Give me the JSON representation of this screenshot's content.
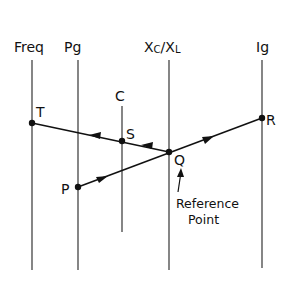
{
  "diagram": {
    "type": "nomogram",
    "axes": [
      {
        "id": "freq",
        "label": "Freq",
        "x": 32,
        "y1": 60,
        "y2": 270
      },
      {
        "id": "pg",
        "label": "Pg",
        "x": 78,
        "y1": 60,
        "y2": 270
      },
      {
        "id": "c",
        "label": "C",
        "x": 122,
        "y1": 106,
        "y2": 232
      },
      {
        "id": "xc_xl",
        "label": "Xc/XL",
        "label_main": "X",
        "sub1": "C",
        "slash": "/",
        "label_main2": "X",
        "sub2": "L",
        "x": 169,
        "y1": 60,
        "y2": 270
      },
      {
        "id": "ig",
        "label": "Ig",
        "x": 262,
        "y1": 60,
        "y2": 268
      }
    ],
    "points": [
      {
        "id": "T",
        "label": "T",
        "x": 32,
        "y": 123
      },
      {
        "id": "S",
        "label": "S",
        "x": 122,
        "y": 141
      },
      {
        "id": "Q",
        "label": "Q",
        "x": 169,
        "y": 152
      },
      {
        "id": "R",
        "label": "R",
        "x": 262,
        "y": 118
      },
      {
        "id": "P",
        "label": "P",
        "x": 78,
        "y": 187
      }
    ],
    "lines": [
      {
        "from": "P",
        "to": "R",
        "direction": "toward R"
      },
      {
        "from": "Q",
        "to": "T",
        "direction": "toward T"
      }
    ],
    "annotation": {
      "line1": "Reference",
      "line2": "Point",
      "points_to": "Q"
    }
  }
}
